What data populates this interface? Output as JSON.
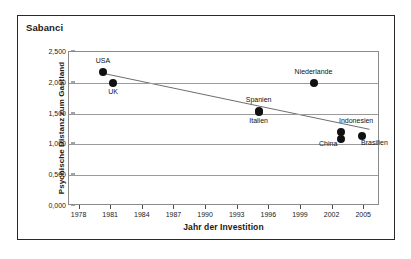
{
  "figure": {
    "title": "Sabanci"
  },
  "chart_data": {
    "type": "scatter",
    "title": "Sabanci",
    "xlabel": "Jahr der Investition",
    "ylabel": "Psychische Distanz zum Gastland",
    "xlim": [
      1977,
      2006.5
    ],
    "ylim": [
      0,
      2.5
    ],
    "xticks": [
      1978,
      1981,
      1984,
      1987,
      1990,
      1993,
      1996,
      1999,
      2002,
      2005
    ],
    "xtick_labels": [
      "1978",
      "1981",
      "1984",
      "1987",
      "1990",
      "1993",
      "1996",
      "1999",
      "2002",
      "2005"
    ],
    "yticks": [
      0,
      0.5,
      1.0,
      1.5,
      2.0,
      2.5
    ],
    "ytick_labels": [
      "0,000",
      "0,500",
      "1,000",
      "1,500",
      "2,000",
      "2,500"
    ],
    "grid": "horizontal",
    "legend": "none",
    "points": [
      {
        "label": "USA",
        "x": 1980.2,
        "y": 2.18,
        "label_pos": "above"
      },
      {
        "label": "UK",
        "x": 1981.2,
        "y": 2.0,
        "label_pos": "below"
      },
      {
        "label": "Spanien",
        "x": 1995.0,
        "y": 1.54,
        "label_pos": "above"
      },
      {
        "label": "Italien",
        "x": 1995.0,
        "y": 1.52,
        "label_pos": "below"
      },
      {
        "label": "Niederlande",
        "x": 2000.2,
        "y": 2.0,
        "label_pos": "above"
      },
      {
        "label": "Indonesien",
        "x": 2002.8,
        "y": 1.2,
        "label_pos": "above-right"
      },
      {
        "label": "China",
        "x": 2002.8,
        "y": 1.09,
        "label_pos": "left"
      },
      {
        "label": "Brasilien",
        "x": 2004.8,
        "y": 1.14,
        "label_pos": "below-right"
      }
    ],
    "trendline": {
      "type": "linear",
      "x_start": 1980.2,
      "y_start": 2.155,
      "x_end": 2005.5,
      "y_end": 1.245
    }
  }
}
